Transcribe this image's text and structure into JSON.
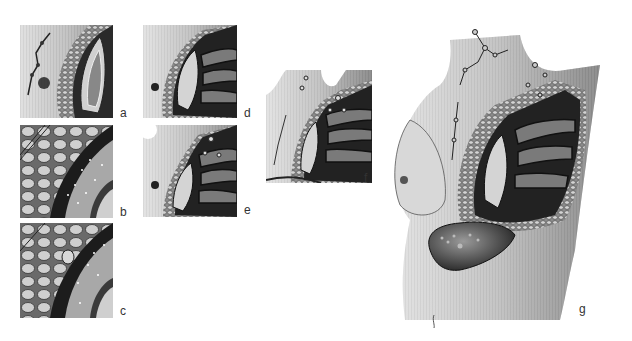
{
  "figure": {
    "panels": [
      {
        "id": "a",
        "label": "a",
        "description": "Breast cross-section: lobular tissue band and pectoral muscle, lymph node chain"
      },
      {
        "id": "b",
        "label": "b",
        "description": "Magnified detail: fat lobules, ducts and muscle with scattered dots"
      },
      {
        "id": "c",
        "label": "c",
        "description": "Magnified detail with nodule on muscle surface"
      },
      {
        "id": "d",
        "label": "d",
        "description": "Breast section with pectoral muscle and axillary structures"
      },
      {
        "id": "e",
        "label": "e",
        "description": "Breast section with axillary lymph nodes"
      },
      {
        "id": "f",
        "label": "f",
        "description": "Wider view of chest wall, breast section and axilla with lymph nodes"
      },
      {
        "id": "g",
        "label": "g",
        "description": "Female torso with sectioned breast, axillary and supraclavicular lymph nodes, and liver with lesions"
      }
    ]
  }
}
